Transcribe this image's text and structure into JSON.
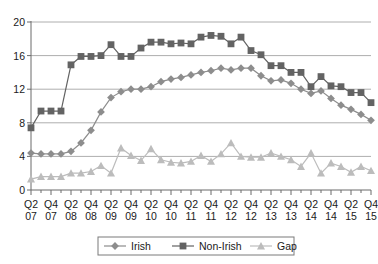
{
  "chart_data": {
    "type": "line",
    "title": "",
    "subtitle": "",
    "xlabel": "",
    "ylabel": "",
    "ylim": [
      0,
      20
    ],
    "yticks": [
      0,
      4,
      8,
      12,
      16,
      20
    ],
    "grid": true,
    "legend_position": "bottom",
    "x": [
      "Q2 07",
      "Q3 07",
      "Q4 07",
      "Q1 08",
      "Q2 08",
      "Q3 08",
      "Q4 08",
      "Q1 09",
      "Q2 09",
      "Q3 09",
      "Q4 09",
      "Q1 10",
      "Q2 10",
      "Q3 10",
      "Q4 10",
      "Q1 11",
      "Q2 11",
      "Q3 11",
      "Q4 11",
      "Q1 12",
      "Q2 12",
      "Q3 12",
      "Q4 12",
      "Q1 13",
      "Q2 13",
      "Q3 13",
      "Q4 13",
      "Q1 14",
      "Q2 14",
      "Q3 14",
      "Q4 14",
      "Q1 15",
      "Q2 15",
      "Q3 15",
      "Q4 15"
    ],
    "tick_labels": [
      {
        "top": "Q2",
        "bottom": "07"
      },
      {
        "top": "Q4",
        "bottom": "07"
      },
      {
        "top": "Q2",
        "bottom": "08"
      },
      {
        "top": "Q4",
        "bottom": "08"
      },
      {
        "top": "Q2",
        "bottom": "09"
      },
      {
        "top": "Q4",
        "bottom": "09"
      },
      {
        "top": "Q2",
        "bottom": "10"
      },
      {
        "top": "Q4",
        "bottom": "10"
      },
      {
        "top": "Q2",
        "bottom": "11"
      },
      {
        "top": "Q4",
        "bottom": "11"
      },
      {
        "top": "Q2",
        "bottom": "12"
      },
      {
        "top": "Q4",
        "bottom": "12"
      },
      {
        "top": "Q2",
        "bottom": "13"
      },
      {
        "top": "Q4",
        "bottom": "13"
      },
      {
        "top": "Q2",
        "bottom": "14"
      },
      {
        "top": "Q4",
        "bottom": "14"
      },
      {
        "top": "Q2",
        "bottom": "15"
      },
      {
        "top": "Q4",
        "bottom": "15"
      }
    ],
    "series": [
      {
        "name": "Irish",
        "marker": "diamond",
        "color": "#8d8d8d",
        "values": [
          4.4,
          4.3,
          4.3,
          4.3,
          4.6,
          5.6,
          7.1,
          9.3,
          11.0,
          11.7,
          12.0,
          12.0,
          12.3,
          12.9,
          13.2,
          13.4,
          13.7,
          14.0,
          14.2,
          14.5,
          14.3,
          14.5,
          14.5,
          13.6,
          13.0,
          13.1,
          12.7,
          12.0,
          11.5,
          11.8,
          10.9,
          10.1,
          9.6,
          9.0,
          8.3
        ]
      },
      {
        "name": "Non-Irish",
        "marker": "square",
        "color": "#636363",
        "values": [
          7.4,
          9.4,
          9.4,
          9.4,
          14.9,
          15.9,
          15.9,
          16.0,
          17.3,
          15.9,
          15.9,
          16.9,
          17.6,
          17.6,
          17.4,
          17.5,
          17.4,
          18.2,
          18.4,
          18.3,
          17.4,
          18.2,
          16.6,
          16.1,
          14.8,
          14.8,
          14.0,
          14.0,
          12.3,
          13.5,
          12.4,
          12.3,
          11.6,
          11.6,
          10.4
        ]
      },
      {
        "name": "Gap",
        "marker": "triangle",
        "color": "#bcbcbc",
        "values": [
          1.3,
          1.6,
          1.6,
          1.6,
          2.0,
          2.0,
          2.2,
          2.9,
          2.0,
          5.0,
          4.1,
          3.5,
          4.9,
          3.6,
          3.3,
          3.2,
          3.4,
          4.1,
          3.4,
          4.3,
          5.6,
          4.0,
          3.9,
          3.9,
          4.4,
          4.0,
          3.6,
          2.8,
          4.4,
          2.0,
          3.2,
          2.8,
          2.1,
          2.8,
          2.3
        ]
      }
    ],
    "legend": [
      {
        "label": "Irish",
        "marker": "diamond",
        "color": "#8d8d8d"
      },
      {
        "label": "Non-Irish",
        "marker": "square",
        "color": "#636363"
      },
      {
        "label": "Gap",
        "marker": "triangle",
        "color": "#bcbcbc"
      }
    ]
  }
}
